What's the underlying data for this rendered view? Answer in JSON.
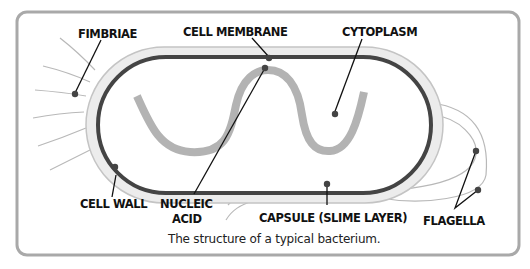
{
  "diagram": {
    "title": "The structure of a typical bacterium.",
    "labels": {
      "fimbriae": "FIMBRIAE",
      "cell_membrane": "CELL MEMBRANE",
      "cytoplasm": "CYTOPLASM",
      "cell_wall": "CELL WALL",
      "nucleic_acid_line1": "NUCLEIC",
      "nucleic_acid_line2": "ACID",
      "capsule": "CAPSULE (SLIME LAYER)",
      "flagella": "FLAGELLA"
    },
    "colors": {
      "frame": "#a9a9a9",
      "capsule_band": "#ececec",
      "capsule_edge": "#c4c4c4",
      "membrane": "#444444",
      "nucleic_acid": "#b3b3b3",
      "appendage": "#b8b8b8",
      "leader": "#111111",
      "dot": "#444444"
    }
  }
}
